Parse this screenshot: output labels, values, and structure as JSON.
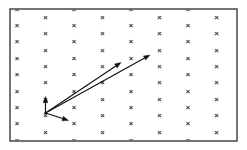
{
  "figure": {
    "width": 247,
    "height": 150,
    "background_color": "#ffffff"
  },
  "chart_data": {
    "type": "scatter",
    "title": "",
    "subtitle": "",
    "xlabel": "",
    "ylabel": "",
    "grid": false,
    "legend": false,
    "legend_position": "none",
    "xlim": [
      10,
      237
    ],
    "ylim": [
      9,
      141
    ],
    "axis_ticks": {
      "x_tick_labels": [],
      "y_tick_labels": []
    },
    "frame": {
      "x": 10,
      "y": 9,
      "width": 227,
      "height": 132,
      "stroke_color": "#3a3a3a",
      "stroke_width": 1.4
    },
    "marker": {
      "symbol": "x",
      "glyph": "×",
      "color": "#2b2b2b",
      "size": 7.6,
      "lattice": "staggered-hexagonal",
      "column_spacing": 28.5,
      "row_spacing": 16.4,
      "row_offset": 8.2,
      "columns_x": [
        17.0,
        45.5,
        74.0,
        102.5,
        131.0,
        159.5,
        188.0,
        216.5
      ],
      "rows_y_even": [
        9.0,
        25.4,
        41.8,
        58.2,
        74.6,
        91.0,
        107.4,
        123.8,
        140.2
      ],
      "rows_y_odd": [
        17.2,
        33.6,
        50.0,
        66.4,
        82.8,
        99.2,
        115.6,
        132.0
      ]
    },
    "points": [
      {
        "x": 17.0,
        "y": 9.0
      },
      {
        "x": 17.0,
        "y": 25.4
      },
      {
        "x": 17.0,
        "y": 41.8
      },
      {
        "x": 17.0,
        "y": 58.2
      },
      {
        "x": 17.0,
        "y": 74.6
      },
      {
        "x": 17.0,
        "y": 91.0
      },
      {
        "x": 17.0,
        "y": 107.4
      },
      {
        "x": 17.0,
        "y": 123.8
      },
      {
        "x": 17.0,
        "y": 140.2
      },
      {
        "x": 45.5,
        "y": 17.2
      },
      {
        "x": 45.5,
        "y": 33.6
      },
      {
        "x": 45.5,
        "y": 50.0
      },
      {
        "x": 45.5,
        "y": 66.4
      },
      {
        "x": 45.5,
        "y": 82.8
      },
      {
        "x": 45.5,
        "y": 99.2
      },
      {
        "x": 45.5,
        "y": 115.6
      },
      {
        "x": 45.5,
        "y": 132.0
      },
      {
        "x": 74.0,
        "y": 9.0
      },
      {
        "x": 74.0,
        "y": 25.4
      },
      {
        "x": 74.0,
        "y": 41.8
      },
      {
        "x": 74.0,
        "y": 58.2
      },
      {
        "x": 74.0,
        "y": 74.6
      },
      {
        "x": 74.0,
        "y": 91.0
      },
      {
        "x": 74.0,
        "y": 107.4
      },
      {
        "x": 74.0,
        "y": 123.8
      },
      {
        "x": 74.0,
        "y": 140.2
      },
      {
        "x": 102.5,
        "y": 17.2
      },
      {
        "x": 102.5,
        "y": 33.6
      },
      {
        "x": 102.5,
        "y": 50.0
      },
      {
        "x": 102.5,
        "y": 66.4
      },
      {
        "x": 102.5,
        "y": 82.8
      },
      {
        "x": 102.5,
        "y": 99.2
      },
      {
        "x": 102.5,
        "y": 115.6
      },
      {
        "x": 102.5,
        "y": 132.0
      },
      {
        "x": 131.0,
        "y": 9.0
      },
      {
        "x": 131.0,
        "y": 25.4
      },
      {
        "x": 131.0,
        "y": 41.8
      },
      {
        "x": 131.0,
        "y": 58.2
      },
      {
        "x": 131.0,
        "y": 74.6
      },
      {
        "x": 131.0,
        "y": 91.0
      },
      {
        "x": 131.0,
        "y": 107.4
      },
      {
        "x": 131.0,
        "y": 123.8
      },
      {
        "x": 131.0,
        "y": 140.2
      },
      {
        "x": 159.5,
        "y": 17.2
      },
      {
        "x": 159.5,
        "y": 33.6
      },
      {
        "x": 159.5,
        "y": 50.0
      },
      {
        "x": 159.5,
        "y": 66.4
      },
      {
        "x": 159.5,
        "y": 82.8
      },
      {
        "x": 159.5,
        "y": 99.2
      },
      {
        "x": 159.5,
        "y": 115.6
      },
      {
        "x": 159.5,
        "y": 132.0
      },
      {
        "x": 188.0,
        "y": 9.0
      },
      {
        "x": 188.0,
        "y": 25.4
      },
      {
        "x": 188.0,
        "y": 41.8
      },
      {
        "x": 188.0,
        "y": 58.2
      },
      {
        "x": 188.0,
        "y": 74.6
      },
      {
        "x": 188.0,
        "y": 91.0
      },
      {
        "x": 188.0,
        "y": 107.4
      },
      {
        "x": 188.0,
        "y": 123.8
      },
      {
        "x": 188.0,
        "y": 140.2
      },
      {
        "x": 216.5,
        "y": 17.2
      },
      {
        "x": 216.5,
        "y": 33.6
      },
      {
        "x": 216.5,
        "y": 50.0
      },
      {
        "x": 216.5,
        "y": 66.4
      },
      {
        "x": 216.5,
        "y": 82.8
      },
      {
        "x": 216.5,
        "y": 99.2
      },
      {
        "x": 216.5,
        "y": 115.6
      },
      {
        "x": 216.5,
        "y": 132.0
      }
    ],
    "vectors": {
      "origin": {
        "x": 45.5,
        "y": 113.0
      },
      "color": "#101010",
      "stroke_width": 1.15,
      "arrows": [
        {
          "name": "vector-up-short",
          "x1": 45.5,
          "y1": 113.0,
          "x2": 45.5,
          "y2": 96.5,
          "length": 16.5,
          "angle_deg": 90
        },
        {
          "name": "vector-diagonal-long",
          "x1": 45.5,
          "y1": 113.0,
          "x2": 150.0,
          "y2": 55.0,
          "length": 119.5,
          "angle_deg": 29.0
        },
        {
          "name": "vector-diagonal-mid",
          "x1": 45.5,
          "y1": 113.0,
          "x2": 121.0,
          "y2": 62.5,
          "length": 90.8,
          "angle_deg": 33.8
        },
        {
          "name": "vector-down-right-short",
          "x1": 45.5,
          "y1": 113.0,
          "x2": 68.5,
          "y2": 120.5,
          "length": 24.2,
          "angle_deg": -18.1
        }
      ]
    }
  }
}
